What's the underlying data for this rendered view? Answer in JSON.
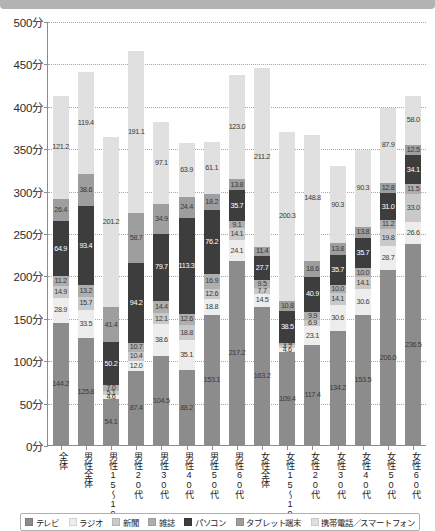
{
  "chart_data": {
    "type": "bar",
    "stacked": true,
    "title": "",
    "xlabel": "",
    "ylabel": "",
    "ylim": [
      0,
      500
    ],
    "ytick_step": 50,
    "yunit": "分",
    "grid": true,
    "legend_position": "bottom",
    "ytick_labels": [
      "0分",
      "50分",
      "100分",
      "150分",
      "200分",
      "250分",
      "300分",
      "350分",
      "400分",
      "450分",
      "500分"
    ],
    "categories": [
      "全体",
      "男性全体",
      "男性15～19歳",
      "男性20代",
      "男性30代",
      "男性40代",
      "男性50代",
      "男性60代",
      "女性全体",
      "女性15～19歳",
      "女性20代",
      "女性30代",
      "女性40代",
      "女性50代",
      "女性60代"
    ],
    "series": [
      {
        "name": "テレビ",
        "color": "#8c8c8c",
        "values": [
          144.2,
          125.8,
          54.1,
          87.4,
          104.5,
          88.2,
          153.1,
          217.2,
          163.2,
          109.4,
          117.4,
          134.2,
          153.5,
          206.0,
          236.5
        ]
      },
      {
        "name": "ラジオ",
        "color": "#ededed",
        "values": [
          28.9,
          33.5,
          4.6,
          12.0,
          38.6,
          35.1,
          18.8,
          24.1,
          14.5,
          4.6,
          23.1,
          30.6,
          30.6,
          28.7,
          26.6
        ]
      },
      {
        "name": "新聞",
        "color": "#c9c9c9",
        "values": [
          14.9,
          15.7,
          5.1,
          10.4,
          12.1,
          18.8,
          12.6,
          14.1,
          7.7,
          4.2,
          6.9,
          14.1,
          14.1,
          19.8,
          33.0
        ]
      },
      {
        "name": "雑誌",
        "color": "#aeaeae",
        "values": [
          11.2,
          13.2,
          7.0,
          10.7,
          14.4,
          12.6,
          16.9,
          9.1,
          9.5,
          1.9,
          9.9,
          10.0,
          10.0,
          11.2,
          11.5
        ]
      },
      {
        "name": "パソコン",
        "color": "#3d3d3d",
        "values": [
          64.9,
          93.4,
          50.2,
          94.2,
          79.7,
          113.3,
          76.2,
          35.7,
          27.7,
          38.5,
          40.9,
          35.7,
          35.7,
          31.0,
          34.1
        ]
      },
      {
        "name": "タブレット端末",
        "color": "#9e9e9e",
        "values": [
          26.4,
          38.6,
          41.4,
          58.7,
          34.9,
          24.4,
          18.2,
          13.8,
          11.4,
          10.8,
          18.6,
          13.8,
          13.8,
          12.8,
          12.5
        ]
      },
      {
        "name": "携帯電話／スマートフォン",
        "color": "#e0e0e0",
        "values": [
          121.2,
          119.4,
          201.2,
          191.1,
          97.1,
          63.9,
          61.1,
          123.0,
          211.2,
          200.3,
          148.8,
          90.3,
          90.3,
          87.9,
          58.0
        ]
      }
    ]
  },
  "legend": {
    "items": [
      {
        "label": "テレビ",
        "color": "#8c8c8c"
      },
      {
        "label": "ラジオ",
        "color": "#ededed"
      },
      {
        "label": "新聞",
        "color": "#c9c9c9"
      },
      {
        "label": "雑誌",
        "color": "#aeaeae"
      },
      {
        "label": "パソコン",
        "color": "#3d3d3d"
      },
      {
        "label": "タブレット端末",
        "color": "#9e9e9e"
      },
      {
        "label": "携帯電話／スマートフォン",
        "color": "#e0e0e0"
      }
    ]
  }
}
